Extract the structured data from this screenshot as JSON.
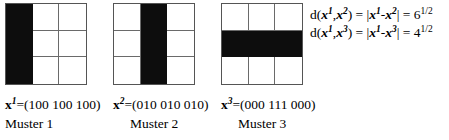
{
  "figure": {
    "type": "pattern-distance-diagram",
    "background_color": "#ffffff",
    "ink_color": "#0d0d0d",
    "grid_line_color": "#6a6a6a"
  },
  "patterns": [
    {
      "id": "grid-1",
      "rows": 3,
      "cols": 3,
      "cells": [
        [
          1,
          0,
          0
        ],
        [
          1,
          0,
          0
        ],
        [
          1,
          0,
          0
        ]
      ],
      "vector_symbol": "x",
      "vector_superscript": "1",
      "vector_equals": "=(100 100 100)",
      "name": "Muster 1"
    },
    {
      "id": "grid-2",
      "rows": 3,
      "cols": 3,
      "cells": [
        [
          0,
          1,
          0
        ],
        [
          0,
          1,
          0
        ],
        [
          0,
          1,
          0
        ]
      ],
      "vector_symbol": "x",
      "vector_superscript": "2",
      "vector_equals": "=(010 010 010)",
      "name": "Muster 2"
    },
    {
      "id": "grid-3",
      "rows": 3,
      "cols": 3,
      "cells": [
        [
          0,
          0,
          0
        ],
        [
          1,
          1,
          1
        ],
        [
          0,
          0,
          0
        ]
      ],
      "vector_symbol": "x",
      "vector_superscript": "3",
      "vector_equals": "=(000 111 000)",
      "name": "Muster 3"
    }
  ],
  "equations": [
    {
      "fn": "d(",
      "arg1_symbol": "x",
      "arg1_sup": "1",
      "comma": ",",
      "arg2_symbol": "x",
      "arg2_sup": "2",
      "close_equals": ") = |",
      "norm1_symbol": "x",
      "norm1_sup": "1",
      "minus": "-",
      "norm2_symbol": "x",
      "norm2_sup": "2",
      "bar_equals": "| = ",
      "value": "6",
      "exponent": "1/2"
    },
    {
      "fn": "d(",
      "arg1_symbol": "x",
      "arg1_sup": "1",
      "comma": ",",
      "arg2_symbol": "x",
      "arg2_sup": "3",
      "close_equals": ") = |",
      "norm1_symbol": "x",
      "norm1_sup": "1",
      "minus": "-",
      "norm2_symbol": "x",
      "norm2_sup": "3",
      "bar_equals": "| = ",
      "value": "4",
      "exponent": "1/2"
    }
  ]
}
